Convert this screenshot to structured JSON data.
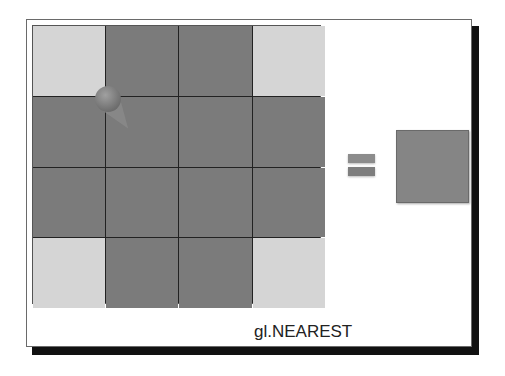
{
  "diagram": {
    "title_label": "gl.NEAREST",
    "texture_grid": {
      "rows": 4,
      "cols": 4,
      "cells": [
        [
          "light",
          "dark",
          "dark",
          "light"
        ],
        [
          "dark",
          "dark",
          "dark",
          "dark"
        ],
        [
          "dark",
          "dark",
          "dark",
          "dark"
        ],
        [
          "light",
          "dark",
          "dark",
          "light"
        ]
      ]
    },
    "sample_point": "sphere-and-cone",
    "operator": "=",
    "result_color": "#858585",
    "colors": {
      "light": "#d5d5d5",
      "dark": "#7b7b7b",
      "shadow": "#111111"
    }
  }
}
